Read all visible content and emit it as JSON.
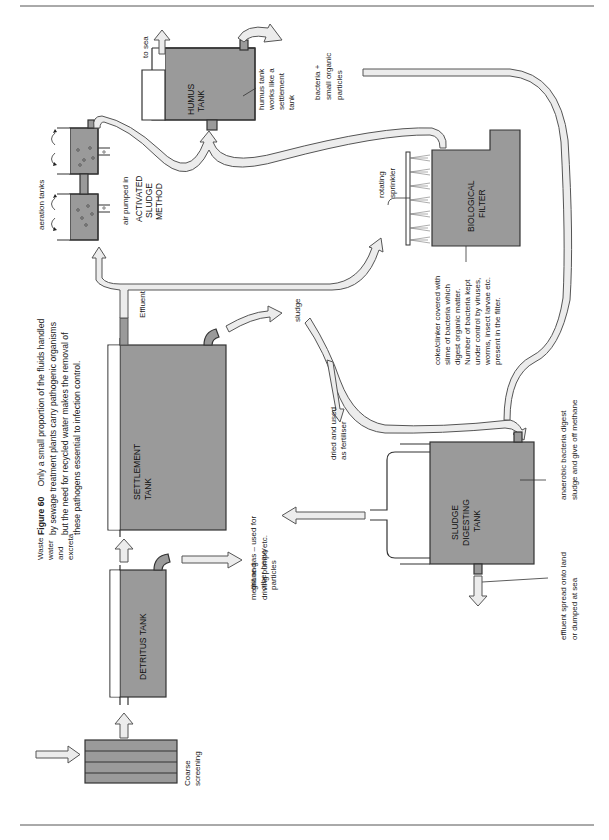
{
  "figure": {
    "number": "Figure 60",
    "caption_lines": [
      "Only a small proportion of the fluids handled",
      "by sewage treatment plants carry pathogenic organisms",
      "but the need for recycled water makes the removal of",
      "these pathogens essential to infection control."
    ]
  },
  "colors": {
    "tank_fill": "#9a9a9a",
    "pipe_fill": "#ececec",
    "outline": "#333333",
    "background": "#ffffff"
  },
  "inputs": {
    "waste": [
      "Waste",
      "water",
      "and",
      "excreta"
    ],
    "coarse_screening": [
      "Coarse",
      "screening"
    ]
  },
  "tanks": {
    "detritus": "DETRITUS TANK",
    "settlement": [
      "SETTLEMENT",
      "TANK"
    ],
    "humus": [
      "HUMUS",
      "TANK"
    ],
    "biological": [
      "BIOLOGICAL",
      "FILTER"
    ],
    "sludge_digesting": [
      "SLUDGE",
      "DIGESTING",
      "TANK"
    ],
    "activated_sludge": [
      "ACTIVATED",
      "SLUDGE",
      "METHOD"
    ]
  },
  "labels": {
    "grit": [
      "grit and",
      "other heavy",
      "particles"
    ],
    "effluent": "Effluent",
    "sludge": "sludge",
    "dried": [
      "dried and used",
      "as fertiliser"
    ],
    "aeration_tanks": "aeration tanks",
    "air_pumped": "air pumped in",
    "to_sea": "to sea",
    "humus_note": [
      "humus tank",
      "works like a",
      "settlement",
      "tank"
    ],
    "bacteria": [
      "bacteria  +",
      "small organic",
      "particles"
    ],
    "rotating_sprinkler": [
      "rotating",
      "sprinkler"
    ],
    "coke_note": [
      "coke/clinker covered with",
      "slime of bacteria which",
      "digest organic matter.",
      "Number of bacteria kept",
      "under control by viruses,",
      "worms, insect larvae etc.",
      "present in the filter."
    ],
    "anaerobic": [
      "anaerobic bacteria digest",
      "sludge and give off methane"
    ],
    "effluent_spread": [
      "effluent spread onto land",
      "or dumped at sea"
    ],
    "methane": [
      "methane gas – used for",
      "driving pumps etc."
    ]
  }
}
